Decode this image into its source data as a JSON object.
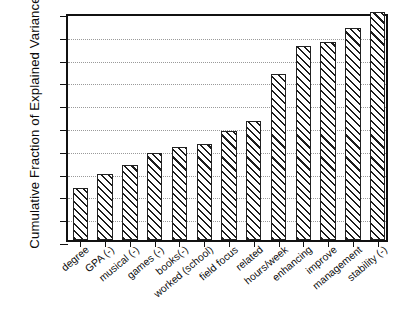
{
  "chart_data": {
    "type": "bar",
    "title": "",
    "xlabel": "",
    "ylabel": "Cumulative Fraction of Explained Variance",
    "ylim": [
      0.0,
      1.0
    ],
    "ytick_labels": [
      "0.0",
      "0.1",
      "0.2",
      "0.3",
      "0.4",
      "0.5",
      "0.6",
      "0.7",
      "0.8",
      "0.9",
      "1.0"
    ],
    "ytick_values": [
      0.0,
      0.1,
      0.2,
      0.3,
      0.4,
      0.5,
      0.6,
      0.7,
      0.8,
      0.9,
      1.0
    ],
    "grid": "horizontal-dotted",
    "legend": "none",
    "categories": [
      "degree",
      "GPA (-)",
      "musical (-)",
      "games (-)",
      "books(-)",
      "worked (school)",
      "field focus",
      "related",
      "hours/week",
      "enhancing",
      "improve",
      "management",
      "stability (-)"
    ],
    "values": [
      0.23,
      0.29,
      0.33,
      0.38,
      0.41,
      0.42,
      0.48,
      0.52,
      0.73,
      0.85,
      0.87,
      0.93,
      1.0
    ],
    "bar_style": {
      "fill": "#ffffff",
      "edge": "#222222",
      "hatch": "diagonal-forward-slash"
    }
  }
}
